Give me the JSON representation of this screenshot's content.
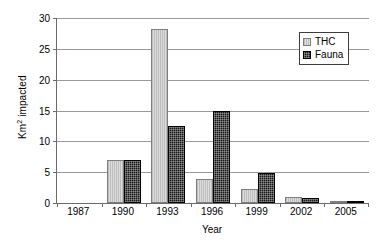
{
  "chart_data": {
    "type": "bar",
    "title": "",
    "xlabel": "Year",
    "ylabel": "Km² impacted",
    "ylabel_base": "Km",
    "ylabel_sup": "2",
    "ylabel_tail": " impacted",
    "categories": [
      "1987",
      "1990",
      "1993",
      "1996",
      "1999",
      "2002",
      "2005"
    ],
    "series": [
      {
        "name": "THC",
        "color": "#c9c9c9",
        "values": [
          0,
          7.0,
          28.2,
          3.9,
          2.3,
          0.9,
          0.4
        ]
      },
      {
        "name": "Fauna",
        "color": "#1a1a1a",
        "values": [
          0,
          7.0,
          12.5,
          15.0,
          4.9,
          0.75,
          0.2
        ]
      }
    ],
    "ylim": [
      0,
      30
    ],
    "y_ticks": [
      0,
      5,
      10,
      15,
      20,
      25,
      30
    ],
    "y_tick_labels": [
      "0",
      "5",
      "10",
      "15",
      "20",
      "25",
      "30"
    ],
    "grid": true,
    "legend_position": "top-right",
    "legend_entries": [
      "THC",
      "Fauna"
    ]
  }
}
